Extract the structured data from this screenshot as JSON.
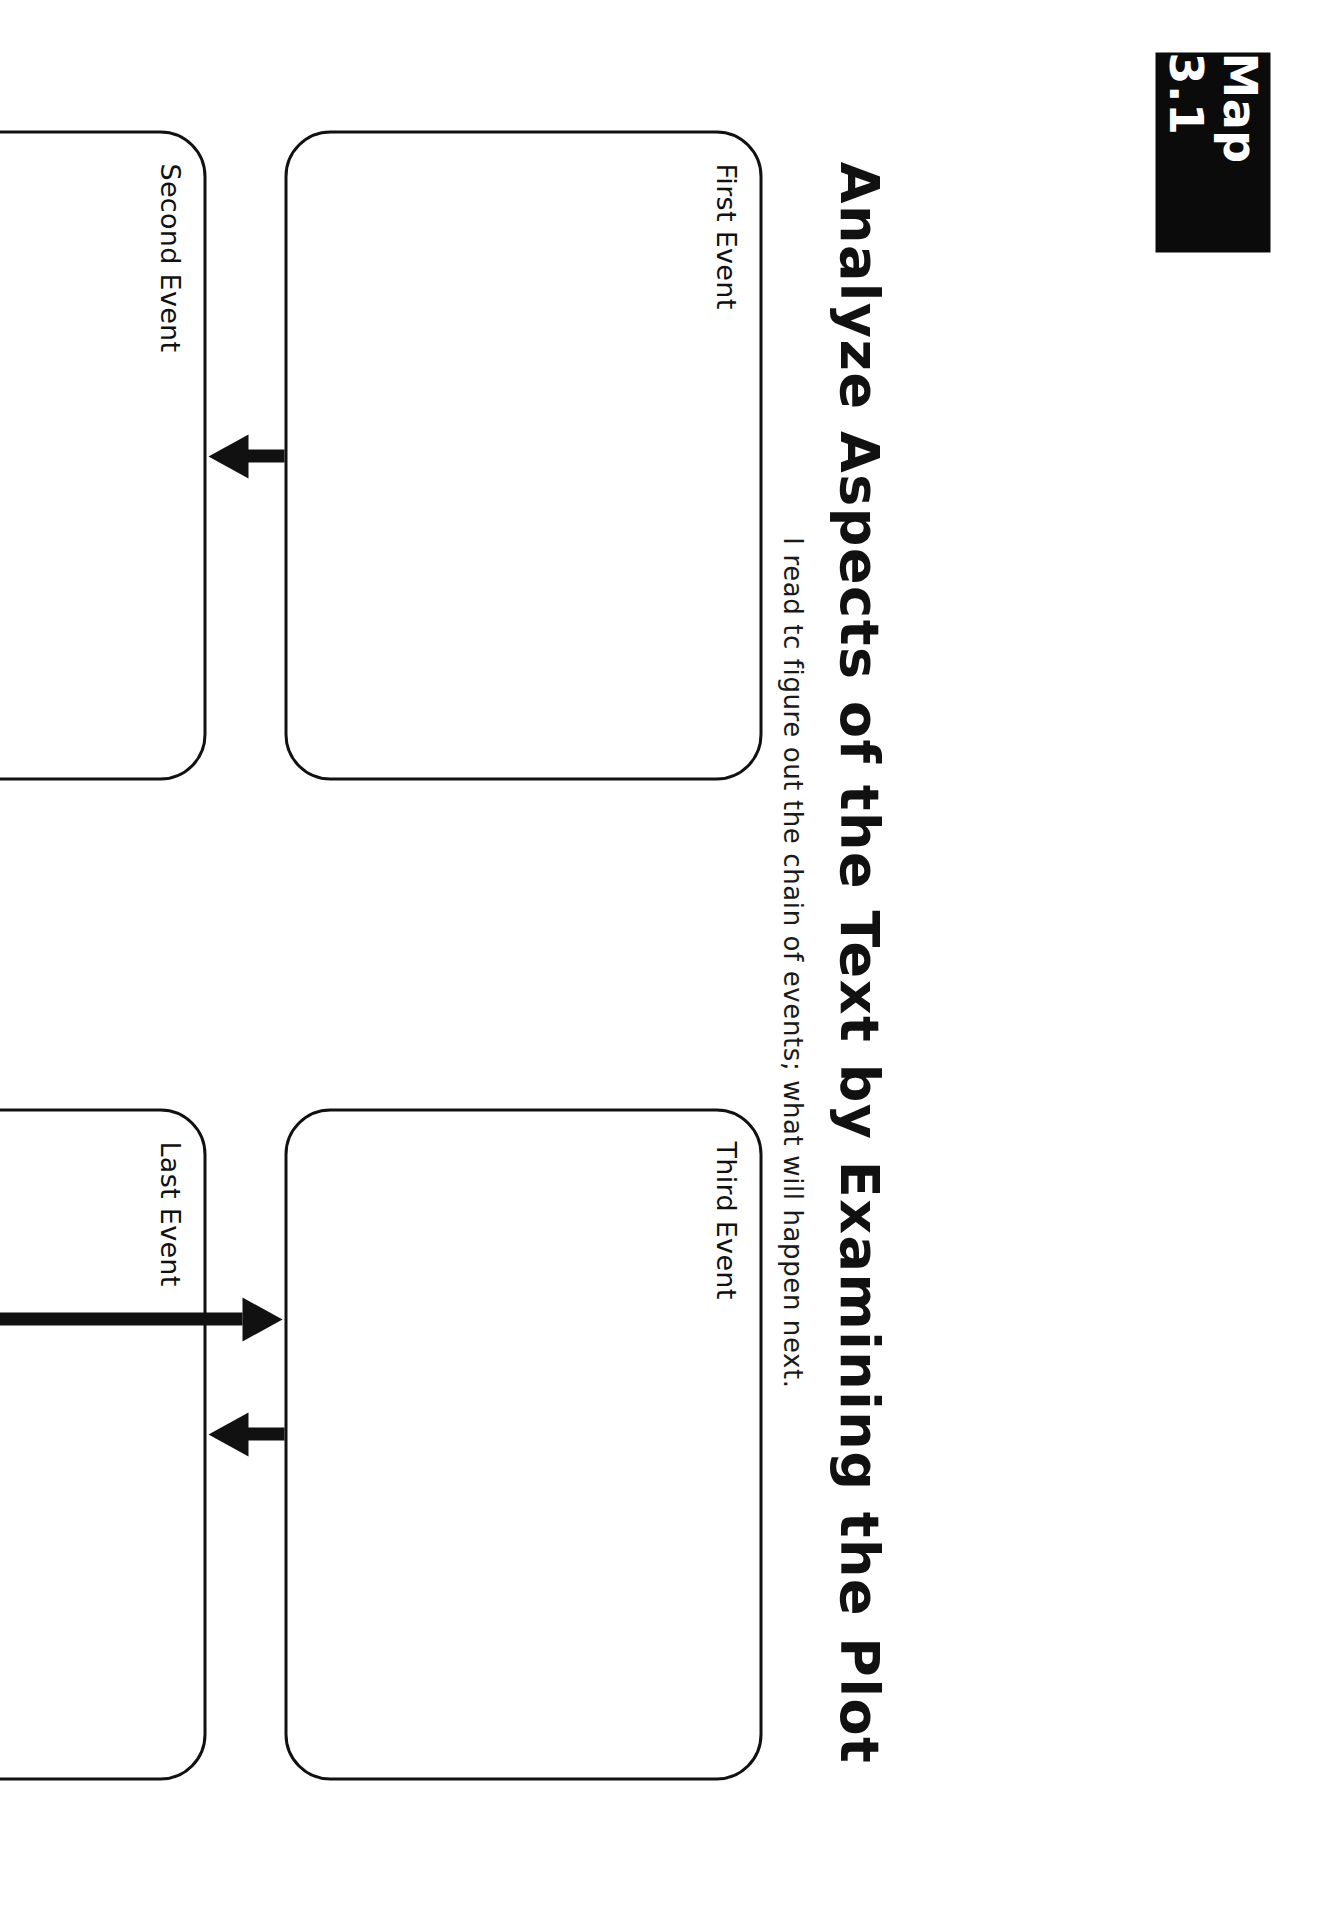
{
  "header": {
    "badge_label": "Map 3.1",
    "title": "Analyze Aspects of the Text by Examining the Plot",
    "subtitle": "I read tc figure out the chain of events; what will happen next."
  },
  "colors": {
    "badge_background": "#0b0b0b",
    "badge_text": "#ffffff",
    "ink": "#111111",
    "page_background": "#ffffff"
  },
  "organizer": {
    "type": "sequence-flow-chart",
    "boxes": [
      {
        "id": "first",
        "label": "First Event",
        "value": ""
      },
      {
        "id": "second",
        "label": "Second Event",
        "value": ""
      },
      {
        "id": "third",
        "label": "Third Event",
        "value": ""
      },
      {
        "id": "last",
        "label": "Last Event",
        "value": ""
      }
    ],
    "connectors": [
      {
        "id": "first-to-second",
        "from": "First Event",
        "to": "Second Event",
        "style": "straight-arrow"
      },
      {
        "id": "second-to-third",
        "from": "Second Event",
        "to": "Third Event",
        "style": "elbow-arrow"
      },
      {
        "id": "third-to-last",
        "from": "Third Event",
        "to": "Last Event",
        "style": "straight-arrow"
      }
    ]
  },
  "page": {
    "orientation_note": "rotated-90-clockwise"
  }
}
